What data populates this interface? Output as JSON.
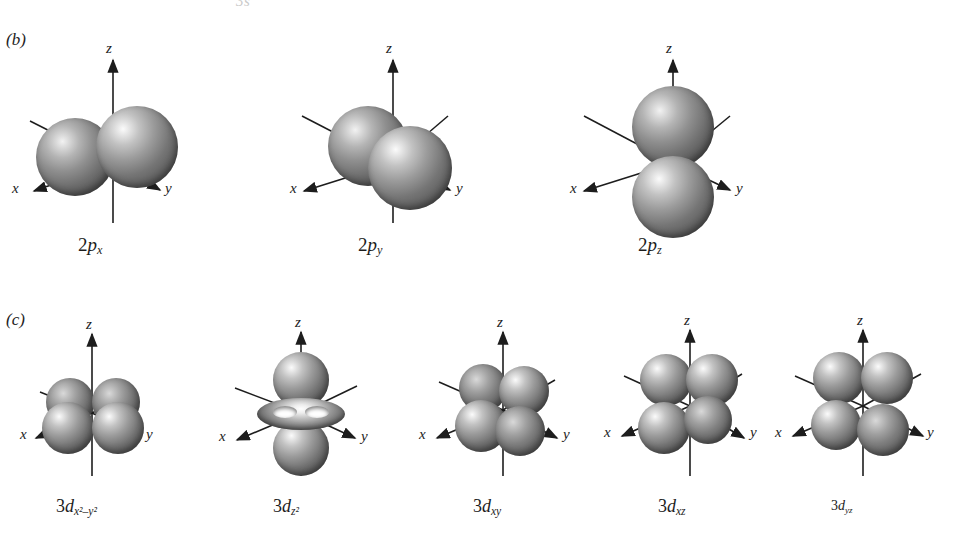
{
  "figure": {
    "top_clipped_text": "3s",
    "panels": [
      {
        "key": "b",
        "letter": "(b)"
      },
      {
        "key": "c",
        "letter": "(c)"
      }
    ],
    "axis_labels": {
      "x": "x",
      "y": "y",
      "z": "z"
    }
  },
  "row_p": {
    "orbitals": [
      {
        "name": "2p-x",
        "principal": "2",
        "type": "p",
        "subscript": "x",
        "label_plain": "2px",
        "shape": "two lobes along x axis"
      },
      {
        "name": "2p-y",
        "principal": "2",
        "type": "p",
        "subscript": "y",
        "label_plain": "2py",
        "shape": "two lobes along y axis"
      },
      {
        "name": "2p-z",
        "principal": "2",
        "type": "p",
        "subscript": "z",
        "label_plain": "2pz",
        "shape": "two lobes along z axis"
      }
    ]
  },
  "row_d": {
    "orbitals": [
      {
        "name": "3d-x2-y2",
        "principal": "3",
        "type": "d",
        "subscript": "x²–y²",
        "label_plain": "3dx2-y2",
        "shape": "four lobes along x and y axes"
      },
      {
        "name": "3d-z2",
        "principal": "3",
        "type": "d",
        "subscript": "z²",
        "label_plain": "3dz2",
        "shape": "two lobes along z axis with equatorial torus"
      },
      {
        "name": "3d-xy",
        "principal": "3",
        "type": "d",
        "subscript": "xy",
        "label_plain": "3dxy",
        "shape": "four lobes between x and y axes"
      },
      {
        "name": "3d-xz",
        "principal": "3",
        "type": "d",
        "subscript": "xz",
        "label_plain": "3dxz",
        "shape": "four lobes between x and z axes"
      },
      {
        "name": "3d-yz",
        "principal": "3",
        "type": "d",
        "subscript": "yz",
        "label_plain": "3dyz",
        "shape": "four lobes between y and z axes"
      }
    ]
  },
  "colors": {
    "background": "#ffffff",
    "axis_line": "#1d1d1d",
    "lobe_shadow": "#4a4a4a",
    "lobe_highlight": "#f5f5f5",
    "text": "#1d1d1d"
  }
}
